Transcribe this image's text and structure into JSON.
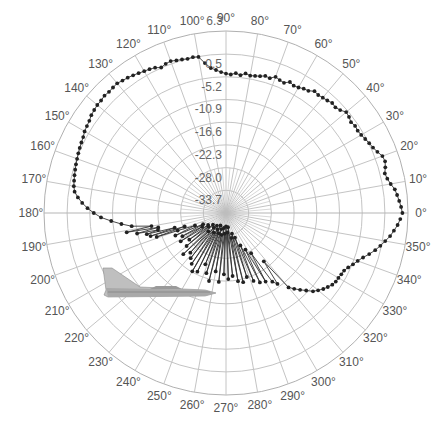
{
  "chart_data": {
    "type": "polar-line",
    "title": "",
    "theta_unit": "degrees",
    "theta_direction": "counterclockwise",
    "theta_zero": "east",
    "angular_ticks": [
      0,
      10,
      20,
      30,
      40,
      50,
      60,
      70,
      80,
      90,
      100,
      110,
      120,
      130,
      140,
      150,
      160,
      170,
      180,
      190,
      200,
      210,
      220,
      230,
      240,
      250,
      260,
      270,
      280,
      290,
      300,
      310,
      320,
      330,
      340,
      350
    ],
    "angular_tick_labels": [
      "0°",
      "10°",
      "20°",
      "30°",
      "40°",
      "50°",
      "60°",
      "70°",
      "80°",
      "90°",
      "100°",
      "110°",
      "120°",
      "130°",
      "140°",
      "150°",
      "160°",
      "170°",
      "180°",
      "190°",
      "200°",
      "210°",
      "220°",
      "230°",
      "240°",
      "250°",
      "260°",
      "270°",
      "280°",
      "290°",
      "300°",
      "310°",
      "320°",
      "330°",
      "340°",
      "350°"
    ],
    "radial_ticks": [
      6.3,
      0.5,
      -5.2,
      -10.9,
      -16.6,
      -22.3,
      -28.0,
      -33.7
    ],
    "radial_tick_labels": [
      "6.3",
      "0.5",
      "-5.2",
      "-10.9",
      "-16.6",
      "-22.3",
      "-28.0",
      "-33.7"
    ],
    "rlim": [
      -39.4,
      6.3
    ],
    "grid": true,
    "legend": null,
    "annotation": "aircraft silhouette (side view) in lower-left quadrant",
    "series": [
      {
        "name": "pattern",
        "marker": "circle",
        "color": "#222222",
        "points": [
          [
            0,
            4.9
          ],
          [
            2,
            4.6
          ],
          [
            4,
            4.2
          ],
          [
            6,
            3.8
          ],
          [
            8,
            3.4
          ],
          [
            10,
            2.6
          ],
          [
            12,
            2.0
          ],
          [
            14,
            1.7
          ],
          [
            16,
            2.2
          ],
          [
            18,
            2.6
          ],
          [
            20,
            2.4
          ],
          [
            22,
            1.6
          ],
          [
            24,
            1.0
          ],
          [
            26,
            0.6
          ],
          [
            28,
            0.2
          ],
          [
            30,
            -0.2
          ],
          [
            32,
            -0.4
          ],
          [
            34,
            -0.3
          ],
          [
            36,
            -0.6
          ],
          [
            38,
            -0.2
          ],
          [
            40,
            0.0
          ],
          [
            42,
            -0.8
          ],
          [
            44,
            -1.2
          ],
          [
            46,
            -1.0
          ],
          [
            48,
            -1.4
          ],
          [
            50,
            -1.6
          ],
          [
            52,
            -1.8
          ],
          [
            54,
            -1.6
          ],
          [
            56,
            -2.4
          ],
          [
            58,
            -2.6
          ],
          [
            60,
            -3.0
          ],
          [
            62,
            -3.2
          ],
          [
            64,
            -2.8
          ],
          [
            66,
            -3.6
          ],
          [
            68,
            -3.4
          ],
          [
            70,
            -3.0
          ],
          [
            72,
            -3.8
          ],
          [
            74,
            -3.6
          ],
          [
            76,
            -4.0
          ],
          [
            78,
            -4.2
          ],
          [
            80,
            -4.4
          ],
          [
            82,
            -4.0
          ],
          [
            84,
            -4.6
          ],
          [
            86,
            -4.2
          ],
          [
            88,
            -4.6
          ],
          [
            90,
            -4.4
          ],
          [
            92,
            -4.0
          ],
          [
            94,
            -3.4
          ],
          [
            96,
            -2.8
          ],
          [
            98,
            -1.4
          ],
          [
            100,
            0.4
          ],
          [
            102,
            0.6
          ],
          [
            104,
            0.5
          ],
          [
            106,
            0.7
          ],
          [
            108,
            0.9
          ],
          [
            110,
            1.2
          ],
          [
            112,
            1.0
          ],
          [
            114,
            0.6
          ],
          [
            116,
            1.2
          ],
          [
            118,
            1.5
          ],
          [
            120,
            1.7
          ],
          [
            122,
            2.0
          ],
          [
            124,
            2.3
          ],
          [
            126,
            2.6
          ],
          [
            128,
            2.8
          ],
          [
            130,
            3.1
          ],
          [
            132,
            3.0
          ],
          [
            134,
            2.9
          ],
          [
            136,
            3.0
          ],
          [
            138,
            2.8
          ],
          [
            140,
            2.8
          ],
          [
            142,
            2.6
          ],
          [
            144,
            2.4
          ],
          [
            146,
            2.0
          ],
          [
            148,
            1.8
          ],
          [
            150,
            1.6
          ],
          [
            152,
            1.2
          ],
          [
            154,
            1.0
          ],
          [
            156,
            0.8
          ],
          [
            158,
            0.6
          ],
          [
            160,
            0.4
          ],
          [
            162,
            0.2
          ],
          [
            164,
            0.0
          ],
          [
            166,
            -0.2
          ],
          [
            168,
            -0.4
          ],
          [
            170,
            -0.6
          ],
          [
            172,
            -1.0
          ],
          [
            174,
            -2.0
          ],
          [
            176,
            -3.2
          ],
          [
            178,
            -4.6
          ],
          [
            180,
            -6.2
          ],
          [
            182,
            -8.0
          ],
          [
            184,
            -10.5
          ],
          [
            186,
            -13.0
          ],
          [
            188,
            -15.5
          ],
          [
            190,
            -20.4
          ],
          [
            191,
            -14.0
          ],
          [
            192,
            -22.0
          ],
          [
            193,
            -16.5
          ],
          [
            194,
            -21.8
          ],
          [
            195,
            -18.8
          ],
          [
            196,
            -26.0
          ],
          [
            197,
            -19.6
          ],
          [
            198,
            -28.5
          ],
          [
            199,
            -21.0
          ],
          [
            200,
            -26.5
          ],
          [
            202,
            -31.0
          ],
          [
            204,
            -25.5
          ],
          [
            206,
            -33.0
          ],
          [
            208,
            -27.0
          ],
          [
            210,
            -32.5
          ],
          [
            212,
            -26.0
          ],
          [
            214,
            -34.0
          ],
          [
            216,
            -28.0
          ],
          [
            218,
            -33.8
          ],
          [
            220,
            -26.5
          ],
          [
            222,
            -35.0
          ],
          [
            224,
            -24.5
          ],
          [
            226,
            -33.0
          ],
          [
            228,
            -26.0
          ],
          [
            230,
            -34.6
          ],
          [
            232,
            -25.0
          ],
          [
            234,
            -35.5
          ],
          [
            236,
            -24.0
          ],
          [
            238,
            -33.6
          ],
          [
            240,
            -22.5
          ],
          [
            242,
            -34.8
          ],
          [
            244,
            -23.0
          ],
          [
            246,
            -36.0
          ],
          [
            248,
            -25.5
          ],
          [
            250,
            -34.0
          ],
          [
            252,
            -23.5
          ],
          [
            254,
            -35.2
          ],
          [
            256,
            -21.8
          ],
          [
            258,
            -33.8
          ],
          [
            260,
            -24.5
          ],
          [
            262,
            -35.6
          ],
          [
            264,
            -22.0
          ],
          [
            266,
            -34.2
          ],
          [
            268,
            -24.0
          ],
          [
            270,
            -36.0
          ],
          [
            272,
            -22.8
          ],
          [
            274,
            -34.5
          ],
          [
            276,
            -23.5
          ],
          [
            278,
            -35.8
          ],
          [
            280,
            -22.0
          ],
          [
            282,
            -33.0
          ],
          [
            284,
            -21.5
          ],
          [
            286,
            -34.0
          ],
          [
            288,
            -22.5
          ],
          [
            290,
            -32.8
          ],
          [
            292,
            -21.0
          ],
          [
            294,
            -30.5
          ],
          [
            296,
            -20.0
          ],
          [
            298,
            -29.0
          ],
          [
            300,
            -19.5
          ],
          [
            302,
            -27.5
          ],
          [
            304,
            -18.6
          ],
          [
            306,
            -17.4
          ],
          [
            308,
            -24.0
          ],
          [
            310,
            -15.0
          ],
          [
            312,
            -13.8
          ],
          [
            314,
            -12.6
          ],
          [
            316,
            -11.4
          ],
          [
            318,
            -10.0
          ],
          [
            320,
            -9.2
          ],
          [
            322,
            -8.4
          ],
          [
            324,
            -7.8
          ],
          [
            326,
            -7.2
          ],
          [
            328,
            -6.9
          ],
          [
            330,
            -6.8
          ],
          [
            332,
            -6.6
          ],
          [
            334,
            -6.4
          ],
          [
            336,
            -5.8
          ],
          [
            338,
            -5.0
          ],
          [
            340,
            -4.2
          ],
          [
            342,
            -3.2
          ],
          [
            344,
            -2.0
          ],
          [
            346,
            -0.8
          ],
          [
            348,
            0.2
          ],
          [
            350,
            1.2
          ],
          [
            352,
            2.2
          ],
          [
            354,
            3.0
          ],
          [
            356,
            3.8
          ],
          [
            358,
            4.4
          ]
        ]
      }
    ]
  },
  "figure": {
    "center_px": [
      226,
      213
    ],
    "outer_radius_px": 182
  }
}
